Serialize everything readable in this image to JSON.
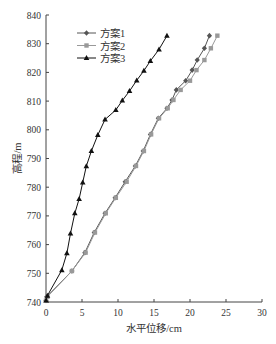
{
  "chart_data": {
    "type": "line",
    "title": "",
    "xlabel": "水平位移/cm",
    "ylabel": "高程/m",
    "xlim": [
      0,
      30
    ],
    "ylim": [
      740,
      840
    ],
    "xticks": [
      0,
      5,
      10,
      15,
      20,
      25,
      30
    ],
    "yticks": [
      740,
      750,
      760,
      770,
      780,
      790,
      800,
      810,
      820,
      830,
      840
    ],
    "grid": false,
    "legend_position": "upper-left",
    "series": [
      {
        "name": "方案1",
        "color": "#555555",
        "marker": "diamond",
        "points": [
          [
            0.0,
            740.5
          ],
          [
            0.1,
            741.8
          ],
          [
            3.6,
            750.8
          ],
          [
            5.4,
            757.2
          ],
          [
            6.7,
            764.2
          ],
          [
            8.2,
            770.9
          ],
          [
            9.6,
            776.3
          ],
          [
            11.0,
            781.9
          ],
          [
            12.4,
            787.4
          ],
          [
            13.5,
            792.6
          ],
          [
            14.5,
            798.4
          ],
          [
            15.6,
            804.0
          ],
          [
            16.8,
            807.5
          ],
          [
            17.5,
            810.4
          ],
          [
            18.1,
            813.9
          ],
          [
            19.4,
            817.1
          ],
          [
            20.3,
            820.8
          ],
          [
            21.0,
            824.3
          ],
          [
            22.0,
            828.4
          ],
          [
            22.7,
            832.8
          ]
        ]
      },
      {
        "name": "方案2",
        "color": "#999999",
        "marker": "square",
        "points": [
          [
            0.0,
            740.5
          ],
          [
            0.2,
            741.8
          ],
          [
            3.6,
            750.8
          ],
          [
            5.5,
            757.2
          ],
          [
            6.8,
            764.2
          ],
          [
            8.3,
            770.9
          ],
          [
            9.7,
            776.3
          ],
          [
            11.2,
            781.9
          ],
          [
            12.5,
            787.4
          ],
          [
            13.6,
            792.6
          ],
          [
            14.6,
            798.4
          ],
          [
            15.7,
            804.0
          ],
          [
            16.9,
            807.5
          ],
          [
            17.7,
            810.4
          ],
          [
            18.7,
            813.9
          ],
          [
            20.0,
            817.1
          ],
          [
            20.9,
            820.8
          ],
          [
            22.0,
            824.3
          ],
          [
            22.9,
            828.4
          ],
          [
            23.8,
            832.8
          ]
        ]
      },
      {
        "name": "方案3",
        "color": "#111111",
        "marker": "triangle",
        "points": [
          [
            0.0,
            740.5
          ],
          [
            0.2,
            742.2
          ],
          [
            2.2,
            751.1
          ],
          [
            2.9,
            757.0
          ],
          [
            3.4,
            763.9
          ],
          [
            4.0,
            770.9
          ],
          [
            4.6,
            775.9
          ],
          [
            5.1,
            781.6
          ],
          [
            5.6,
            787.3
          ],
          [
            6.3,
            792.6
          ],
          [
            7.2,
            798.2
          ],
          [
            8.2,
            803.6
          ],
          [
            9.7,
            806.9
          ],
          [
            10.6,
            810.2
          ],
          [
            11.6,
            813.5
          ],
          [
            12.6,
            817.2
          ],
          [
            13.6,
            820.6
          ],
          [
            14.5,
            824.0
          ],
          [
            15.7,
            828.0
          ],
          [
            16.8,
            832.8
          ]
        ]
      }
    ]
  }
}
